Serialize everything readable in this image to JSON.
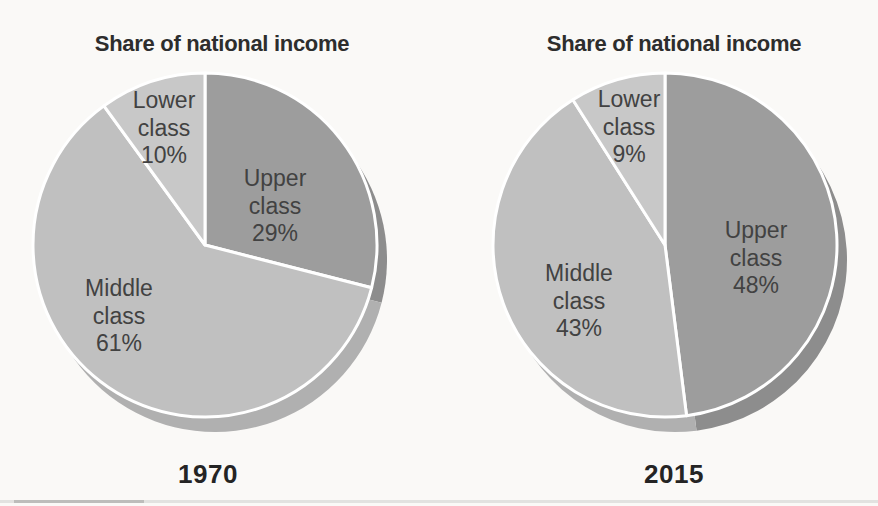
{
  "page": {
    "background_color": "#faf9f7",
    "title_color": "#2d2d2d",
    "slice_label_color": "#424242",
    "year_color": "#242424",
    "divider_color": "#ffffff"
  },
  "chart_data": [
    {
      "type": "pie",
      "title": "Share of national income",
      "year": "1970",
      "start_angle": "12-oclock",
      "direction": "clockwise",
      "label_format": "{label} {value}%",
      "slices": [
        {
          "label": "Upper class",
          "value": 29,
          "color": "#9d9d9d",
          "shadow_color": "#8d8d8d"
        },
        {
          "label": "Middle class",
          "value": 61,
          "color": "#c0c0c0",
          "shadow_color": "#b0b0b0"
        },
        {
          "label": "Lower class",
          "value": 10,
          "color": "#c8c8c8",
          "shadow_color": "#b8b8b8"
        }
      ]
    },
    {
      "type": "pie",
      "title": "Share of national income",
      "year": "2015",
      "start_angle": "12-oclock",
      "direction": "clockwise",
      "label_format": "{label} {value}%",
      "slices": [
        {
          "label": "Upper class",
          "value": 48,
          "color": "#9d9d9d",
          "shadow_color": "#8d8d8d"
        },
        {
          "label": "Middle class",
          "value": 43,
          "color": "#c0c0c0",
          "shadow_color": "#b0b0b0"
        },
        {
          "label": "Lower class",
          "value": 9,
          "color": "#c8c8c8",
          "shadow_color": "#b8b8b8"
        }
      ]
    }
  ]
}
